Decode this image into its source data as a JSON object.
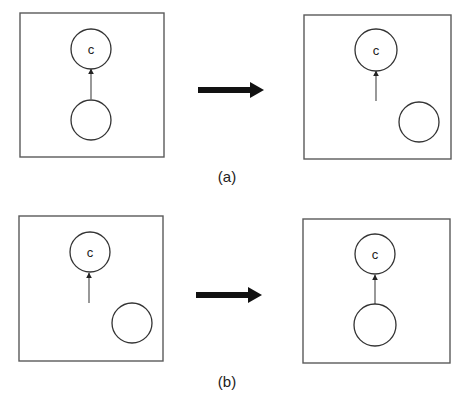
{
  "figure": {
    "rows": [
      {
        "id": "a",
        "caption": "(a)",
        "caption_pos": [
          227,
          182
        ],
        "transition_arrow": {
          "x1": 198,
          "x2": 252,
          "y": 90,
          "head_to": 264,
          "color": "#111111"
        },
        "panels": [
          {
            "name": "before",
            "box": {
              "x": 20,
              "y": 13,
              "w": 144,
              "h": 144
            },
            "nodes": [
              {
                "id": "c",
                "label": "c",
                "cx": 91,
                "cy": 49,
                "r": 20
              },
              {
                "id": "unlabeled",
                "label": "",
                "cx": 91,
                "cy": 120,
                "r": 20
              }
            ],
            "edge": {
              "x": 91,
              "y_from": 99,
              "y_to": 69,
              "connected": true
            }
          },
          {
            "name": "after",
            "box": {
              "x": 304,
              "y": 15,
              "w": 147,
              "h": 144
            },
            "nodes": [
              {
                "id": "c",
                "label": "c",
                "cx": 376,
                "cy": 50,
                "r": 21
              },
              {
                "id": "unlabeled",
                "label": "",
                "cx": 419,
                "cy": 122,
                "r": 20
              }
            ],
            "edge": {
              "x": 376,
              "y_from": 101,
              "y_to": 71,
              "connected": false
            }
          }
        ]
      },
      {
        "id": "b",
        "caption": "(b)",
        "caption_pos": [
          227,
          387
        ],
        "transition_arrow": {
          "x1": 196,
          "x2": 250,
          "y": 295,
          "head_to": 262,
          "color": "#111111"
        },
        "panels": [
          {
            "name": "before",
            "box": {
              "x": 19,
              "y": 216,
              "w": 144,
              "h": 145
            },
            "nodes": [
              {
                "id": "c",
                "label": "c",
                "cx": 90,
                "cy": 252,
                "r": 20
              },
              {
                "id": "unlabeled",
                "label": "",
                "cx": 132,
                "cy": 323,
                "r": 20
              }
            ],
            "edge": {
              "x": 89,
              "y_from": 303,
              "y_to": 273,
              "connected": false
            }
          },
          {
            "name": "after",
            "box": {
              "x": 303,
              "y": 219,
              "w": 147,
              "h": 144
            },
            "nodes": [
              {
                "id": "c",
                "label": "c",
                "cx": 375,
                "cy": 254,
                "r": 20
              },
              {
                "id": "unlabeled",
                "label": "",
                "cx": 375,
                "cy": 325,
                "r": 21
              }
            ],
            "edge": {
              "x": 375,
              "y_from": 304,
              "y_to": 275,
              "connected": true
            }
          }
        ]
      }
    ]
  }
}
